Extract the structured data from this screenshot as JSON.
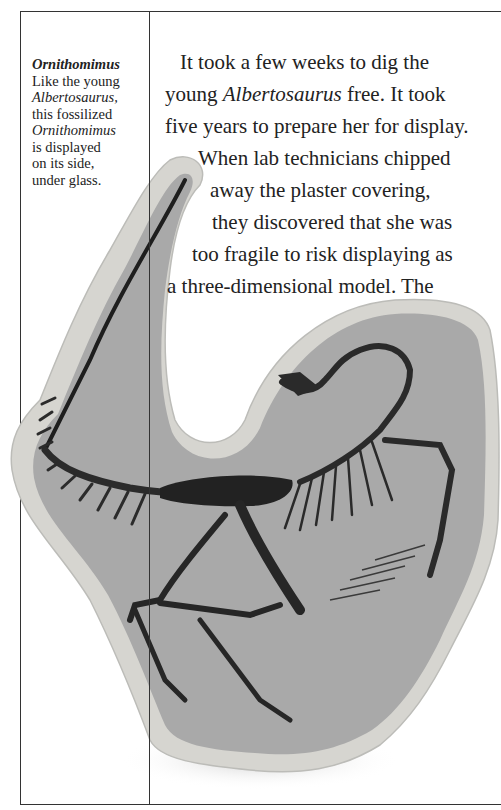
{
  "caption": {
    "title": "Ornithomimus",
    "lines": [
      {
        "text": "Like the young",
        "italic": false
      },
      {
        "text": "Albertosaurus,",
        "italic": true
      },
      {
        "text": "this fossilized",
        "italic": false
      },
      {
        "text": "Ornithomimus",
        "italic": true
      },
      {
        "text": "is displayed",
        "italic": false
      },
      {
        "text": "on its side,",
        "italic": false
      },
      {
        "text": "under glass.",
        "italic": false
      }
    ]
  },
  "body": {
    "line1": "It took a few weeks to dig the",
    "line2_pre": "young ",
    "line2_italic": "Albertosaurus",
    "line2_post": " free. It took",
    "line3": "five years to prepare her for display.",
    "line4": "When lab technicians chipped",
    "line5": "away the plaster covering,",
    "line6": "they discovered that she was",
    "line7": "too fragile to risk displaying as",
    "line8": "a three-dimensional model. The"
  },
  "image": {
    "subject": "Ornithomimus fossil skeleton in rock slab",
    "colors": {
      "slab": "#a9a9a9",
      "rim": "#d9d9d6",
      "bone": "#2b2b2b"
    }
  }
}
